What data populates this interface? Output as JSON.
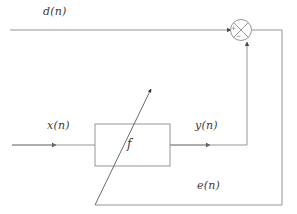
{
  "figure": {
    "type": "block-diagram",
    "background_color": "#ffffff",
    "line_color": "#8a8a8a",
    "text_color": "#3b3b3b"
  },
  "labels": {
    "desired_signal": "d(n)",
    "input_signal": "x(n)",
    "output_signal": "y(n)",
    "error_signal": "e(n)",
    "filter_block": "f"
  },
  "summing_junction": {
    "name": "summing-junction",
    "plus_sign": "+",
    "minus_sign": "−",
    "glyph": "cross-circle"
  },
  "blocks": [
    {
      "id": "filter",
      "label": "f",
      "shape": "rectangle"
    }
  ],
  "signals": [
    {
      "name": "d(n)",
      "from": "external-input",
      "to": "summing-junction",
      "polarity": "+"
    },
    {
      "name": "x(n)",
      "from": "external-input",
      "to": "filter"
    },
    {
      "name": "y(n)",
      "from": "filter",
      "to": "summing-junction",
      "polarity": "−"
    },
    {
      "name": "e(n)",
      "from": "summing-junction",
      "to": "filter-adaptation"
    }
  ]
}
